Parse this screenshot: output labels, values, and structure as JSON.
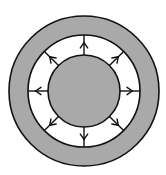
{
  "diagram": {
    "width": 166,
    "height": 175,
    "center": {
      "x": 84,
      "y": 91
    },
    "outer_ring": {
      "radius": 75,
      "fill": "#a9a9a9",
      "stroke": "#111111"
    },
    "gap_ring": {
      "radius": 56,
      "fill": "#ffffff",
      "stroke": "#111111"
    },
    "inner_circle": {
      "radius": 36,
      "fill": "#a9a9a9",
      "stroke": "#111111"
    },
    "arrows": {
      "count": 8,
      "direction": "outward",
      "from_radius": 36,
      "to_radius": 56,
      "angles_deg": [
        0,
        45,
        90,
        135,
        180,
        225,
        270,
        315
      ],
      "stroke": "#111111"
    }
  }
}
